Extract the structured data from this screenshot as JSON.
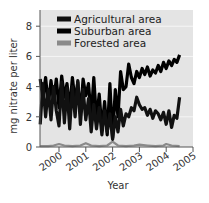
{
  "chart_data": {
    "type": "line",
    "title": "",
    "xlabel": "Year",
    "ylabel": "mg nitrate per liter",
    "xlim": [
      1999.3,
      2005
    ],
    "ylim": [
      0,
      8.5
    ],
    "xticks": [
      2000,
      2001,
      2002,
      2003,
      2004,
      2005
    ],
    "xtick_labels": [
      "2000",
      "2001",
      "2002",
      "2003",
      "2004",
      "2005"
    ],
    "yticks": [
      0,
      2,
      4,
      6,
      8
    ],
    "ytick_labels": [
      "0",
      "2",
      "4",
      "6",
      "8"
    ],
    "grid": "horizontal",
    "legend_position": "upper left",
    "series": [
      {
        "name": "Agricultural area",
        "color": "#111111",
        "x": [
          1999.3,
          1999.4,
          1999.5,
          1999.6,
          1999.7,
          1999.8,
          1999.9,
          2000.0,
          2000.1,
          2000.2,
          2000.3,
          2000.4,
          2000.5,
          2000.6,
          2000.7,
          2000.8,
          2000.9,
          2001.0,
          2001.1,
          2001.2,
          2001.3,
          2001.4,
          2001.5,
          2001.6,
          2001.7,
          2001.8,
          2001.9,
          2002.0,
          2002.1,
          2002.2,
          2002.3,
          2002.4,
          2002.5,
          2002.6,
          2002.7,
          2002.8,
          2002.9,
          2003.0,
          2003.1,
          2003.2,
          2003.3,
          2003.4,
          2003.5,
          2003.6,
          2003.7,
          2003.8,
          2003.9,
          2004.0,
          2004.1,
          2004.2,
          2004.3,
          2004.4,
          2004.5
        ],
        "y": [
          1.5,
          4.2,
          2.0,
          3.8,
          1.8,
          4.0,
          2.4,
          1.4,
          4.3,
          1.6,
          3.9,
          1.2,
          4.0,
          2.0,
          4.4,
          1.5,
          3.8,
          1.8,
          3.2,
          1.0,
          2.8,
          1.2,
          2.6,
          0.8,
          2.4,
          1.0,
          2.2,
          0.5,
          2.0,
          1.0,
          2.5,
          1.4,
          2.2,
          2.0,
          2.6,
          2.4,
          3.3,
          2.8,
          2.5,
          2.6,
          2.1,
          2.5,
          1.9,
          2.4,
          2.2,
          1.8,
          2.3,
          1.5,
          2.4,
          1.3,
          2.1,
          1.9,
          3.3
        ]
      },
      {
        "name": "Suburban area",
        "color": "#000000",
        "x": [
          1999.3,
          1999.4,
          1999.5,
          1999.6,
          1999.7,
          1999.8,
          1999.9,
          2000.0,
          2000.1,
          2000.2,
          2000.3,
          2000.4,
          2000.5,
          2000.6,
          2000.7,
          2000.8,
          2000.9,
          2001.0,
          2001.1,
          2001.2,
          2001.3,
          2001.4,
          2001.5,
          2001.6,
          2001.7,
          2001.8,
          2001.9,
          2002.0,
          2002.1,
          2002.2,
          2002.3,
          2002.4,
          2002.5,
          2002.6,
          2002.7,
          2002.8,
          2002.9,
          2003.0,
          2003.1,
          2003.2,
          2003.3,
          2003.4,
          2003.5,
          2003.6,
          2003.7,
          2003.8,
          2003.9,
          2004.0,
          2004.1,
          2004.2,
          2004.3,
          2004.4,
          2004.5
        ],
        "y": [
          4.5,
          3.2,
          4.6,
          2.8,
          4.4,
          3.0,
          4.5,
          2.6,
          4.7,
          3.3,
          4.2,
          2.5,
          4.6,
          3.0,
          4.3,
          2.2,
          4.5,
          3.4,
          4.2,
          2.0,
          4.6,
          1.8,
          3.5,
          1.2,
          3.0,
          0.8,
          4.2,
          0.6,
          3.8,
          2.0,
          5.0,
          3.8,
          4.0,
          5.5,
          4.6,
          4.2,
          5.0,
          4.6,
          5.2,
          4.8,
          5.3,
          4.7,
          5.1,
          4.9,
          5.4,
          5.0,
          5.6,
          5.2,
          5.7,
          5.4,
          5.8,
          5.6,
          6.1
        ]
      },
      {
        "name": "Forested area",
        "color": "#8a8a8a",
        "x": [
          1999.3,
          1999.6,
          1999.8,
          2000.0,
          2000.2,
          2000.5,
          2000.8,
          2001.0,
          2001.2,
          2001.5,
          2001.8,
          2002.0,
          2002.2,
          2002.5,
          2002.8,
          2003.0,
          2003.3,
          2003.6,
          2003.9,
          2004.0,
          2004.2,
          2004.5
        ],
        "y": [
          0.05,
          0.05,
          0.1,
          0.2,
          0.1,
          0.05,
          0.1,
          0.25,
          0.1,
          0.05,
          0.1,
          0.35,
          0.1,
          0.05,
          0.1,
          0.15,
          0.1,
          0.05,
          0.1,
          0.2,
          0.1,
          0.05
        ]
      }
    ]
  }
}
